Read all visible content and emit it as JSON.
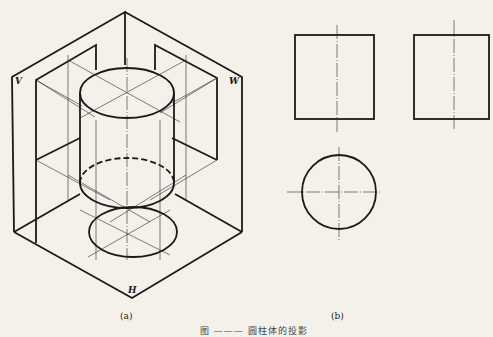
{
  "figure_a": {
    "caption": "(a)",
    "plane_labels": {
      "v": "V",
      "w": "W",
      "h": "H"
    }
  },
  "figure_b": {
    "caption": "(b)"
  },
  "figure_caption": "图 ——— 圆柱体的投影"
}
